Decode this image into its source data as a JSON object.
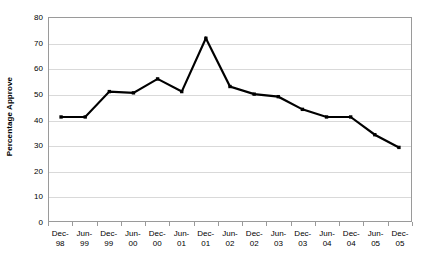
{
  "chart_data": {
    "type": "line",
    "title": "",
    "subtitle": "",
    "xlabel": "",
    "ylabel": "Percentage Approve",
    "ylim": [
      0,
      80
    ],
    "ytick_values": [
      0,
      10,
      20,
      30,
      40,
      50,
      60,
      70,
      80
    ],
    "ytick_labels": [
      "0",
      "10",
      "20",
      "30",
      "40",
      "50",
      "60",
      "70",
      "80"
    ],
    "grid": true,
    "legend": false,
    "legend_position": "none",
    "marker": "square",
    "line_color": "#000000",
    "categories": [
      "Dec-98",
      "Jun-99",
      "Dec-99",
      "Jun-00",
      "Dec-00",
      "Jun-01",
      "Dec-01",
      "Jun-02",
      "Dec-02",
      "Jun-03",
      "Dec-03",
      "Jun-04",
      "Dec-04",
      "Jun-05",
      "Dec-05"
    ],
    "xtick_labels": [
      {
        "line1": "Dec-",
        "line2": "98"
      },
      {
        "line1": "Jun-",
        "line2": "99"
      },
      {
        "line1": "Dec-",
        "line2": "99"
      },
      {
        "line1": "Jun-",
        "line2": "00"
      },
      {
        "line1": "Dec-",
        "line2": "00"
      },
      {
        "line1": "Jun-",
        "line2": "01"
      },
      {
        "line1": "Dec-",
        "line2": "01"
      },
      {
        "line1": "Jun-",
        "line2": "02"
      },
      {
        "line1": "Dec-",
        "line2": "02"
      },
      {
        "line1": "Jun-",
        "line2": "03"
      },
      {
        "line1": "Dec-",
        "line2": "03"
      },
      {
        "line1": "Jun-",
        "line2": "04"
      },
      {
        "line1": "Dec-",
        "line2": "04"
      },
      {
        "line1": "Jun-",
        "line2": "05"
      },
      {
        "line1": "Dec-",
        "line2": "05"
      }
    ],
    "values": [
      41,
      41,
      51,
      50.5,
      56,
      51,
      72,
      53,
      50,
      49,
      44,
      41,
      41,
      34,
      29
    ],
    "series": [
      {
        "name": "Percentage Approve",
        "values": [
          41,
          41,
          51,
          50.5,
          56,
          51,
          72,
          53,
          50,
          49,
          44,
          41,
          41,
          34,
          29
        ]
      }
    ]
  }
}
